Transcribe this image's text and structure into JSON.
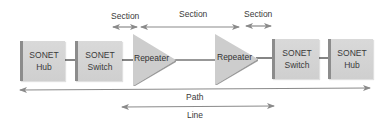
{
  "diagram": {
    "nodes": [
      {
        "id": "hub-left",
        "type": "SONET Hub",
        "line1": "SONET",
        "line2": "Hub"
      },
      {
        "id": "switch-left",
        "type": "SONET Switch",
        "line1": "SONET",
        "line2": "Switch"
      },
      {
        "id": "repeater-left",
        "type": "Repeater",
        "label": "Repeater"
      },
      {
        "id": "repeater-right",
        "type": "Repeater",
        "label": "Repeater"
      },
      {
        "id": "switch-right",
        "type": "SONET Switch",
        "line1": "SONET",
        "line2": "Switch"
      },
      {
        "id": "hub-right",
        "type": "SONET Hub",
        "line1": "SONET",
        "line2": "Hub"
      }
    ],
    "spans": {
      "section_left": "Section",
      "section_middle": "Section",
      "section_right": "Section",
      "path": "Path",
      "line": "Line"
    },
    "colors": {
      "box_fill": "#d4d4d4",
      "box_edge": "#8c8c8c",
      "repeater_fill": "#cfcfcf",
      "arrow": "#8a8a8a",
      "link": "#333333",
      "text": "#3a3a3a"
    }
  }
}
